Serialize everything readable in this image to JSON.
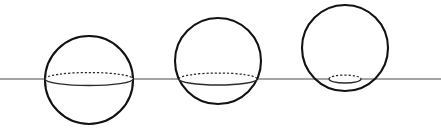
{
  "figure": {
    "caption": "",
    "width": 441,
    "height": 133,
    "background_color": "#ffffff"
  },
  "chart_data": {
    "type": "diagram",
    "subtitle": "",
    "xlabel": "",
    "ylabel": "",
    "grid": false,
    "legend": null,
    "annotations": [],
    "plane": {
      "name": "horizontal-plane-line",
      "orientation": "horizontal",
      "y": 79,
      "x_start": 0,
      "x_end": 441,
      "stroke_color": "#4a4a4a",
      "stroke_width": 1.15
    },
    "spheres": [
      {
        "id": "sphere-1",
        "label": "left-sphere",
        "center_x": 89,
        "center_y": 80,
        "radius": 44,
        "stroke_color": "#121212",
        "stroke_width": 2.1,
        "cross_section": {
          "center_x": 89,
          "center_y": 79,
          "semi_major_axis": 44,
          "semi_minor_axis": 6.5,
          "hidden_arc_dashed": true,
          "visible_arc_solid": true,
          "stroke_color": "#2b2b2b"
        },
        "plane_offset_from_center": 1,
        "description": "Plane passes through the center; cross-section is a great circle (widest ellipse)."
      },
      {
        "id": "sphere-2",
        "label": "middle-sphere",
        "center_x": 218,
        "center_y": 61,
        "radius": 43,
        "stroke_color": "#121212",
        "stroke_width": 2.1,
        "cross_section": {
          "center_x": 218,
          "center_y": 79,
          "semi_major_axis": 39,
          "semi_minor_axis": 6.0,
          "hidden_arc_dashed": true,
          "visible_arc_solid": true,
          "stroke_color": "#2b2b2b"
        },
        "plane_offset_from_center": 18,
        "description": "Plane passes below the center; cross-section ellipse is smaller than the great circle."
      },
      {
        "id": "sphere-3",
        "label": "right-sphere",
        "center_x": 345,
        "center_y": 48,
        "radius": 43,
        "stroke_color": "#121212",
        "stroke_width": 2.1,
        "cross_section": {
          "center_x": 345,
          "center_y": 79,
          "semi_major_axis": 16,
          "semi_minor_axis": 4.0,
          "hidden_arc_dashed": true,
          "visible_arc_solid": true,
          "stroke_color": "#2b2b2b"
        },
        "plane_offset_from_center": 31,
        "description": "Plane passes near the bottom of the sphere; cross-section ellipse is very small."
      }
    ]
  }
}
